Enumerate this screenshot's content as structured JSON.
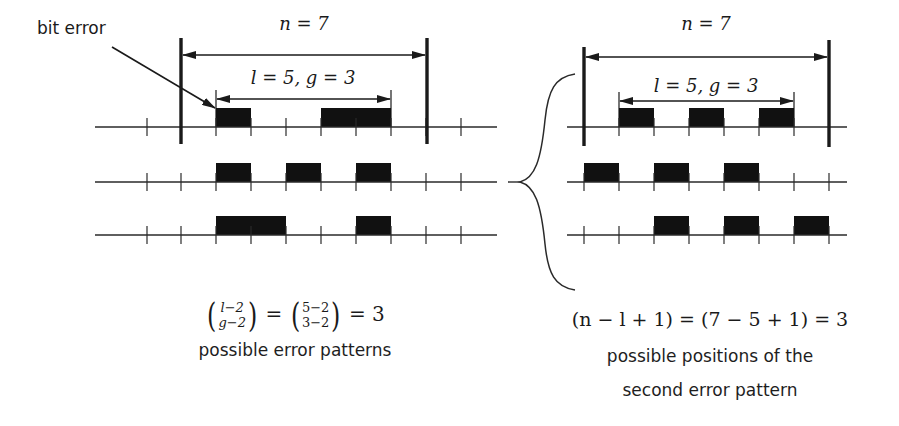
{
  "colors": {
    "ink": "#1a1a1a",
    "line": "#2a2a2a",
    "background": "#ffffff"
  },
  "left_panel": {
    "annotation": "bit error",
    "n_label": "n = 7",
    "lg_label": "l = 5, g = 3",
    "rows": [
      {
        "errors": [
          [
            216,
            251
          ],
          [
            321,
            391
          ]
        ]
      },
      {
        "errors": [
          [
            216,
            251
          ],
          [
            286,
            321
          ],
          [
            356,
            391
          ]
        ]
      },
      {
        "errors": [
          [
            216,
            286
          ],
          [
            356,
            391
          ]
        ]
      }
    ],
    "formula_lhs_top": "l−2",
    "formula_lhs_bottom": "g−2",
    "formula_rhs_top": "5−2",
    "formula_rhs_bottom": "3−2",
    "formula_result": "= 3",
    "caption": "possible error patterns"
  },
  "right_panel": {
    "n_label": "n = 7",
    "lg_label": "l = 5, g = 3",
    "rows": [
      {
        "errors": [
          [
            619,
            654
          ],
          [
            689,
            724
          ],
          [
            759,
            794
          ]
        ]
      },
      {
        "errors": [
          [
            584,
            619
          ],
          [
            654,
            689
          ],
          [
            724,
            759
          ]
        ]
      },
      {
        "errors": [
          [
            654,
            689
          ],
          [
            724,
            759
          ],
          [
            794,
            829
          ]
        ]
      }
    ],
    "formula": "(n − l + 1) = (7 − 5 + 1) = 3",
    "caption_line1": "possible positions of the",
    "caption_line2": "second error pattern"
  },
  "geometry": {
    "row_y": [
      127,
      182,
      235
    ],
    "left": {
      "axis_x": [
        95,
        497
      ],
      "ticks": [
        147,
        181,
        216,
        251,
        286,
        321,
        356,
        391,
        426,
        461
      ],
      "window": [
        181,
        427
      ],
      "l_span": [
        216,
        391
      ]
    },
    "right": {
      "axis_x": [
        567,
        847
      ],
      "ticks": [
        584,
        619,
        654,
        689,
        724,
        759,
        794,
        829
      ],
      "window": [
        584,
        829
      ],
      "l_span": [
        619,
        794
      ]
    }
  }
}
